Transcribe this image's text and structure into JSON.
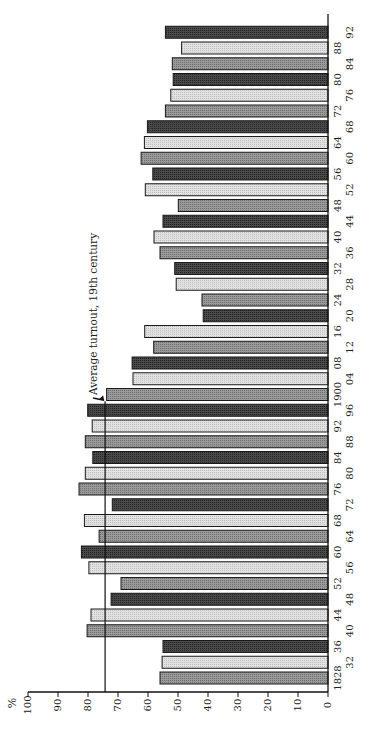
{
  "chart_data": {
    "type": "bar",
    "orientation": "rotated-90",
    "title": "",
    "xlabel": "",
    "ylabel": "%",
    "ylim": [
      0,
      100
    ],
    "yticks": [
      "0",
      "10",
      "20",
      "30",
      "40",
      "50",
      "60",
      "70",
      "80",
      "90",
      "100"
    ],
    "grid": false,
    "legend": null,
    "categories": [
      "1828",
      "1832",
      "1836",
      "1840",
      "1844",
      "1848",
      "1852",
      "1856",
      "1860",
      "1864",
      "1868",
      "1872",
      "1876",
      "1880",
      "1884",
      "1888",
      "1892",
      "1896",
      "1900",
      "1904",
      "1908",
      "1912",
      "1916",
      "1920",
      "1924",
      "1928",
      "1932",
      "1936",
      "1940",
      "1944",
      "1948",
      "1952",
      "1956",
      "1960",
      "1964",
      "1968",
      "1972",
      "1976",
      "1980",
      "1984",
      "1988",
      "1992"
    ],
    "tick_labels": [
      "1828",
      "32",
      "36",
      "40",
      "44",
      "48",
      "52",
      "56",
      "60",
      "64",
      "68",
      "72",
      "76",
      "80",
      "84",
      "88",
      "92",
      "96",
      "1900",
      "04",
      "08",
      "12",
      "16",
      "20",
      "24",
      "28",
      "32",
      "36",
      "40",
      "44",
      "48",
      "52",
      "56",
      "60",
      "64",
      "68",
      "72",
      "76",
      "80",
      "84",
      "88",
      "92"
    ],
    "values": [
      56,
      55.3,
      55,
      80.3,
      79,
      72.3,
      69,
      79.7,
      82.2,
      76.3,
      81.2,
      71.9,
      83,
      80.9,
      78.4,
      80.9,
      78.6,
      80.1,
      73.8,
      65,
      65.3,
      58.1,
      61.1,
      41.6,
      42,
      50.6,
      51.1,
      56,
      58,
      55,
      49.9,
      60.9,
      58.4,
      62.3,
      61.2,
      60.2,
      54.2,
      52.4,
      51.6,
      51.9,
      48.8,
      54.2
    ],
    "reference_line": {
      "value": 74.3,
      "from_category": "1828",
      "to_category": "1896"
    },
    "annotations": [
      {
        "text": "Average turnout, 19th century",
        "near_category": "1896",
        "arrow": true
      }
    ],
    "fill_pattern_cycle": [
      "#8c8c8c",
      "#d6d6d6",
      "#3c3c3c"
    ]
  }
}
